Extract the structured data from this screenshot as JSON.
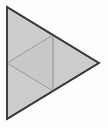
{
  "figure": {
    "name": "triangle-with-medial-triangle",
    "width": 108,
    "height": 128,
    "background_color": "#fdfdfd",
    "outer_triangle": {
      "label": "outer-triangle",
      "points": "7,7 7,119 99,63",
      "fill_color": "#cccccc",
      "stroke_color": "#3a3a3a",
      "stroke_width": 1.6
    },
    "medial_triangle": {
      "label": "medial-triangle",
      "points": "7,63 53,35 53,91",
      "fill_color": "#c8c8c8",
      "stroke_color": "#9a9a9a",
      "stroke_width": 1.0
    },
    "vertical_segment": {
      "label": "vertical-chord",
      "x1": 53,
      "y1": 35,
      "x2": 53,
      "y2": 91,
      "stroke_color": "#a8a8a8",
      "stroke_width": 1.0
    },
    "vertices": {
      "top_left": "7,7",
      "bottom_left": "7,119",
      "right": "99,63",
      "left_midpoint": "7,63",
      "upper_midpoint": "53,35",
      "lower_midpoint": "53,91"
    }
  }
}
